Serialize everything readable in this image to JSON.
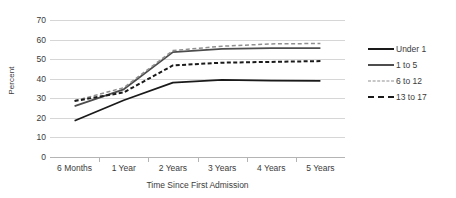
{
  "chart_data": {
    "type": "line",
    "title": "",
    "xlabel": "Time Since First Admission",
    "ylabel": "Percent",
    "categories": [
      "6 Months",
      "1 Year",
      "2 Years",
      "3 Years",
      "4 Years",
      "5 Years"
    ],
    "ylim": [
      0,
      70
    ],
    "ytick_step": 10,
    "yticks": [
      "70",
      "60",
      "50",
      "40",
      "30",
      "20",
      "10",
      "0"
    ],
    "ytick_values": [
      70,
      60,
      50,
      40,
      30,
      20,
      10,
      0
    ],
    "grid": true,
    "legend_position": "right",
    "series": [
      {
        "name": "Under 1",
        "style": "solid",
        "color": "#1a1a1a",
        "values": [
          18.5,
          29.0,
          38.0,
          39.4,
          39.0,
          38.9
        ]
      },
      {
        "name": "1 to 5",
        "style": "solid",
        "color": "#4d4d4d",
        "values": [
          26.0,
          34.6,
          53.6,
          55.2,
          55.6,
          55.6
        ]
      },
      {
        "name": "6 to 12",
        "style": "dashed-light",
        "color": "#8f8f8f",
        "values": [
          28.7,
          35.4,
          54.4,
          56.6,
          57.8,
          58.0
        ]
      },
      {
        "name": "13 to 17",
        "style": "dashed-bold",
        "color": "#1a1a1a",
        "values": [
          28.6,
          33.0,
          46.8,
          48.2,
          48.6,
          49.0
        ]
      }
    ]
  },
  "legend": {
    "items": [
      {
        "label": "Under 1",
        "swatch": "solid-line-swatch"
      },
      {
        "label": "1 to 5",
        "swatch": "solid-line-swatch"
      },
      {
        "label": "6 to 12",
        "swatch": "dashed-light-line-swatch"
      },
      {
        "label": "13 to 17",
        "swatch": "dashed-bold-line-swatch"
      }
    ]
  }
}
